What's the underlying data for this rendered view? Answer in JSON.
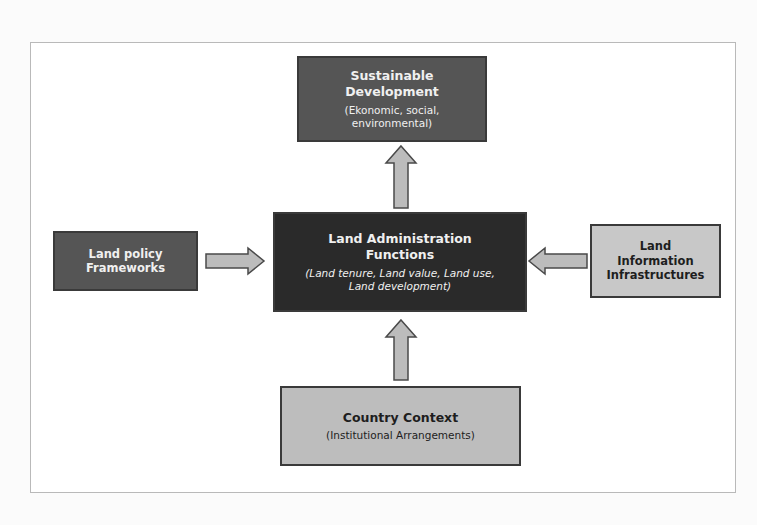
{
  "diagram": {
    "nodes": {
      "sustainable": {
        "title_line1": "Sustainable",
        "title_line2": "Development",
        "sub_line1": "(Ekonomic, social,",
        "sub_line2": "environmental)"
      },
      "policy": {
        "title_line1": "Land policy",
        "title_line2": "Frameworks"
      },
      "admin": {
        "title_line1": "Land Administration",
        "title_line2": "Functions",
        "sub_line1": "(Land tenure, Land value, Land use,",
        "sub_line2": "Land development)"
      },
      "info": {
        "title_line1": "Land",
        "title_line2": "Information",
        "title_line3": "Infrastructures"
      },
      "country": {
        "title": "Country Context",
        "sub": "(Institutional Arrangements)"
      }
    },
    "edges": [
      {
        "from": "admin",
        "to": "sustainable",
        "direction": "up"
      },
      {
        "from": "policy",
        "to": "admin",
        "direction": "right"
      },
      {
        "from": "info",
        "to": "admin",
        "direction": "left"
      },
      {
        "from": "country",
        "to": "admin",
        "direction": "up"
      }
    ],
    "colors": {
      "dark_fill": "#2a2a2a",
      "mid_fill": "#555555",
      "light_fill": "#bdbdbd",
      "arrow_fill": "#bcbcbc",
      "border": "#3a3a3a"
    }
  }
}
